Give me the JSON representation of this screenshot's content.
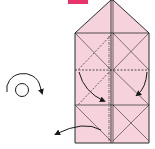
{
  "diagram": {
    "type": "origami-fold-instruction",
    "step_badge": {
      "color": "#e8336b",
      "label": ""
    },
    "paper": {
      "fill": "#f6d3dc",
      "stroke": "#2a2a2a"
    },
    "symbols": [
      {
        "name": "turn-over-icon",
        "meaning": "turn the model over"
      },
      {
        "name": "fold-arrow-left",
        "meaning": "fold inward (left flap)"
      },
      {
        "name": "fold-arrow-right",
        "meaning": "fold inward (right flap)"
      },
      {
        "name": "pull-out-arrow",
        "meaning": "pull / unfold outward"
      }
    ],
    "line_types": {
      "solid": "existing edge / crease",
      "dashed": "valley fold",
      "dash-dot": "mountain fold"
    }
  }
}
